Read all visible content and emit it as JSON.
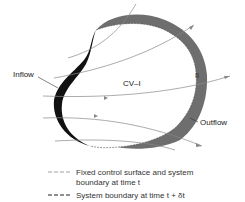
{
  "diagram": {
    "labels": {
      "inflow": "Inflow",
      "outflow": "Outflow",
      "cv": "CV–I",
      "region_ii": "II"
    },
    "legend": [
      {
        "line_style": "light-dashed",
        "text_line1": "Fixed control surface and system",
        "text_line2": "boundary at time t"
      },
      {
        "line_style": "heavy-dashed",
        "text_line1": "System boundary at time t + δt"
      }
    ],
    "colors": {
      "inflow_region": "#111111",
      "outflow_region": "#6e6e6e",
      "streamlines": "#888888",
      "background": "#ffffff"
    }
  }
}
